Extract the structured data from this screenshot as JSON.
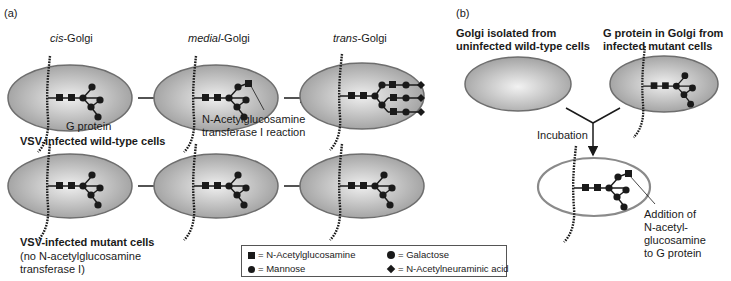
{
  "panels": {
    "a": {
      "label": "(a)",
      "stages": [
        {
          "prefix": "cis",
          "suffix": "-Golgi"
        },
        {
          "prefix": "medial",
          "suffix": "-Golgi"
        },
        {
          "prefix": "trans",
          "suffix": "-Golgi"
        }
      ],
      "g_protein_label": "G protein",
      "wildtype_label": "VSV-infected wild-type cells",
      "enzyme_label_line1": "N-Acetylglucosamine",
      "enzyme_label_line2": "transferase I reaction",
      "mutant_label": "VSV-infected mutant cells",
      "mutant_note_line1": "(no N-acetylglucosamine",
      "mutant_note_line2": "transferase I)"
    },
    "b": {
      "label": "(b)",
      "left_title_line1": "Golgi isolated from",
      "left_title_line2": "uninfected wild-type cells",
      "right_title_line1": "G protein in Golgi from",
      "right_title_line2": "infected mutant cells",
      "incubation_label": "Incubation",
      "result_line1": "Addition of",
      "result_line2": "N-acetyl-",
      "result_line3": "glucosamine",
      "result_line4": "to G protein"
    }
  },
  "legend": {
    "items": [
      {
        "symbol": "square",
        "label": "N-Acetylglucosamine"
      },
      {
        "symbol": "circle-large",
        "label": "Galactose"
      },
      {
        "symbol": "circle",
        "label": "Mannose"
      },
      {
        "symbol": "diamond",
        "label": "N-Acetylneuraminic acid"
      }
    ]
  },
  "colors": {
    "golgi_fill_edge": "#9a9a9a",
    "golgi_fill_center": "#ececec",
    "golgi_outline": "#6e6e6e",
    "sugar": "#1a1a1a"
  }
}
